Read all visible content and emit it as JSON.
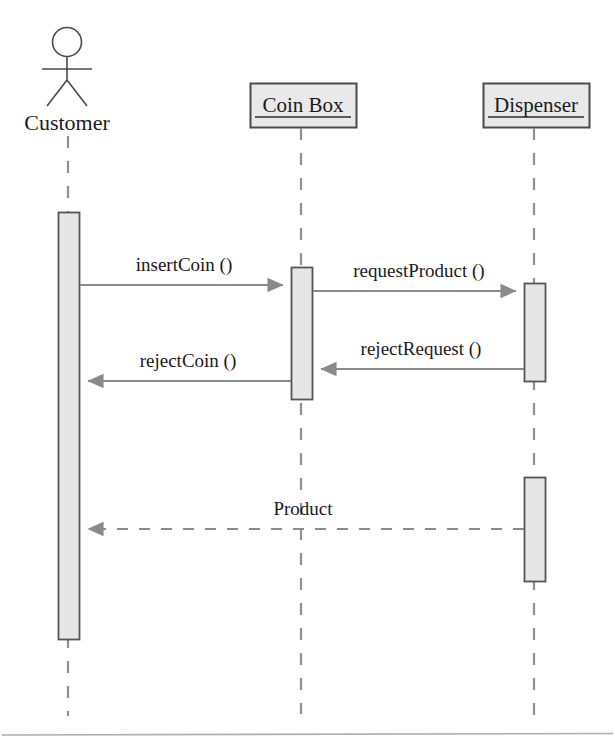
{
  "diagram": {
    "type": "uml-sequence-diagram",
    "colors": {
      "line": "#6e6e6e",
      "box_stroke": "#4a4a4a",
      "box_fill": "#e9e9e9",
      "activation_fill": "#e6e6e6",
      "activation_stroke": "#555555",
      "text": "#1a1a1a",
      "arrowhead": "#808080",
      "background": "#ffffff"
    },
    "participants": [
      {
        "id": "customer",
        "name": "Customer",
        "shape": "actor-stick-figure",
        "underlined": false,
        "x": 68,
        "label_y": 125
      },
      {
        "id": "coinbox",
        "name": "Coin Box",
        "shape": "object-box",
        "underlined": true,
        "x": 301,
        "box": {
          "x": 250,
          "y": 83,
          "width": 107,
          "height": 45
        }
      },
      {
        "id": "dispenser",
        "name": "Dispenser",
        "shape": "object-box",
        "underlined": true,
        "x": 534,
        "box": {
          "x": 483,
          "y": 83,
          "width": 107,
          "height": 45
        }
      }
    ],
    "lifelines": [
      {
        "participant": "customer",
        "x": 68,
        "y1": 136,
        "y2": 716
      },
      {
        "participant": "coinbox",
        "x": 301,
        "y1": 128,
        "y2": 714
      },
      {
        "participant": "dispenser",
        "x": 534,
        "y1": 128,
        "y2": 716
      }
    ],
    "activations": [
      {
        "participant": "customer",
        "x": 58,
        "y": 212,
        "width": 22,
        "height": 428
      },
      {
        "participant": "coinbox",
        "x": 291,
        "y": 267,
        "width": 22,
        "height": 133
      },
      {
        "participant": "dispenser",
        "x": 524,
        "y": 283,
        "width": 22,
        "height": 99
      },
      {
        "participant": "dispenser",
        "x": 524,
        "y": 477,
        "width": 22,
        "height": 105
      }
    ],
    "messages": [
      {
        "order": 1,
        "label": "insertCoin ()",
        "from": "customer",
        "to": "coinbox",
        "direction": "right",
        "style": "solid",
        "y": 285,
        "x1": 80,
        "x2": 289,
        "label_x": 184,
        "label_y": 271
      },
      {
        "order": 2,
        "label": "requestProduct ()",
        "from": "coinbox",
        "to": "dispenser",
        "direction": "right",
        "style": "solid",
        "y": 291,
        "x1": 313,
        "x2": 522,
        "label_x": 417,
        "label_y": 277
      },
      {
        "order": 3,
        "label": "rejectRequest ()",
        "from": "dispenser",
        "to": "coinbox",
        "direction": "left",
        "style": "solid",
        "y": 369,
        "x1": 524,
        "x2": 315,
        "label_x": 419,
        "label_y": 355
      },
      {
        "order": 4,
        "label": "rejectCoin ()",
        "from": "coinbox",
        "to": "customer",
        "direction": "left",
        "style": "solid",
        "y": 381,
        "x1": 291,
        "x2": 82,
        "label_x": 186,
        "label_y": 367
      },
      {
        "order": 5,
        "label": "Product",
        "from": "dispenser",
        "to": "customer",
        "direction": "left",
        "style": "dashed",
        "y": 529,
        "x1": 524,
        "x2": 82,
        "label_x": 303,
        "label_y": 515
      }
    ],
    "footer_rule": {
      "x1": 2,
      "y1": 735,
      "x2": 613,
      "y2": 734
    }
  }
}
